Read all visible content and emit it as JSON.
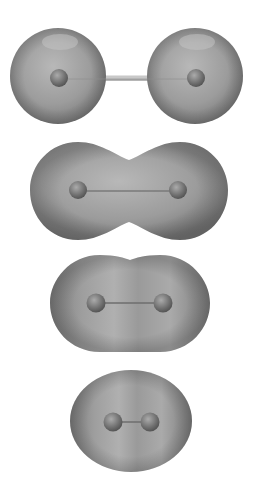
{
  "figure": {
    "colors": {
      "background": "#ffffff",
      "surface_light": "#b4b4b4",
      "surface_mid": "#9a9a9a",
      "surface_dark": "#7a7a7a",
      "nucleus_light": "#a8a8a8",
      "nucleus_dark": "#5e5e5e",
      "bond": "#8c8c8c"
    },
    "panels": [
      {
        "id": "separated",
        "shape": "two-spheres",
        "nuclei": [
          [
            58,
            78
          ],
          [
            195,
            78
          ]
        ]
      },
      {
        "id": "dumbbell",
        "shape": "dumbbell",
        "nuclei": [
          [
            78,
            190
          ],
          [
            178,
            190
          ]
        ]
      },
      {
        "id": "capsule",
        "shape": "capsule",
        "nuclei": [
          [
            95,
            302
          ],
          [
            163,
            302
          ]
        ]
      },
      {
        "id": "ellipsoid",
        "shape": "ellipsoid",
        "nuclei": [
          [
            112,
            422
          ],
          [
            150,
            422
          ]
        ]
      }
    ]
  }
}
